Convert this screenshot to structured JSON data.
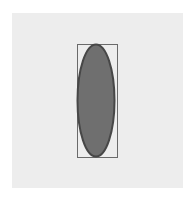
{
  "canvas": {
    "x": 12,
    "y": 13,
    "width": 171,
    "height": 175,
    "fill": "#ededed"
  },
  "shapes": {
    "bounding_box": {
      "type": "rect",
      "x": 77,
      "y": 44,
      "width": 40,
      "height": 113,
      "stroke": "#6a6a6a",
      "stroke_width": 1,
      "fill": "none"
    },
    "ellipse": {
      "type": "ellipse",
      "cx": 96,
      "cy": 100.5,
      "rx": 18.5,
      "ry": 56,
      "fill": "#6f6f6f",
      "stroke": "#474747",
      "stroke_width": 2
    }
  }
}
